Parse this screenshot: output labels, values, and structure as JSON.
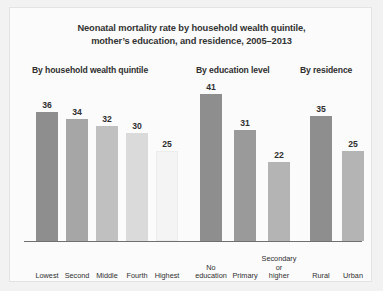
{
  "chart_data": {
    "type": "bar",
    "title_lines": [
      "Neonatal mortality rate by household wealth quintile,",
      "mother’s education, and residence, 2005–2013"
    ],
    "xlabel": "",
    "ylabel": "",
    "ylim": [
      0,
      41
    ],
    "grid": false,
    "legend": "none",
    "categories": [
      "Lowest",
      "Second",
      "Middle",
      "Fourth",
      "Highest",
      "No education",
      "Primary",
      "Secondary or higher",
      "Rural",
      "Urban"
    ],
    "values": [
      36,
      34,
      32,
      30,
      25,
      41,
      31,
      22,
      35,
      25
    ],
    "groups": [
      {
        "name": "By household wealth quintile",
        "categories": [
          "Lowest",
          "Second",
          "Middle",
          "Fourth",
          "Highest"
        ],
        "values": [
          36,
          34,
          32,
          30,
          25
        ],
        "colors": [
          "#8e8e8e",
          "#a6a6a6",
          "#c0c0c0",
          "#dadada",
          "#f4f4f4"
        ]
      },
      {
        "name": "By education level",
        "categories": [
          "No education",
          "Primary",
          "Secondary or higher"
        ],
        "values": [
          41,
          31,
          22
        ],
        "colors": [
          "#8e8e8e",
          "#9a9a9a",
          "#b4b4b4"
        ]
      },
      {
        "name": "By residence",
        "categories": [
          "Rural",
          "Urban"
        ],
        "values": [
          35,
          25
        ],
        "colors": [
          "#8e8e8e",
          "#b4b4b4"
        ]
      }
    ],
    "bars": [
      {
        "label_lines": [
          "Lowest"
        ],
        "value": 36,
        "color": "#8e8e8e",
        "x": 26
      },
      {
        "label_lines": [
          "Second"
        ],
        "value": 34,
        "color": "#a6a6a6",
        "x": 56
      },
      {
        "label_lines": [
          "Middle"
        ],
        "value": 32,
        "color": "#c0c0c0",
        "x": 86
      },
      {
        "label_lines": [
          "Fourth"
        ],
        "value": 30,
        "color": "#dadada",
        "x": 116
      },
      {
        "label_lines": [
          "Highest"
        ],
        "value": 25,
        "color": "#f4f4f4",
        "x": 146
      },
      {
        "label_lines": [
          "No",
          "education"
        ],
        "value": 41,
        "color": "#8e8e8e",
        "x": 190
      },
      {
        "label_lines": [
          "Primary"
        ],
        "value": 31,
        "color": "#9a9a9a",
        "x": 224
      },
      {
        "label_lines": [
          "Secondary",
          "or",
          "higher"
        ],
        "value": 22,
        "color": "#b4b4b4",
        "x": 258
      },
      {
        "label_lines": [
          "Rural"
        ],
        "value": 35,
        "color": "#8e8e8e",
        "x": 300
      },
      {
        "label_lines": [
          "Urban"
        ],
        "value": 25,
        "color": "#b4b4b4",
        "x": 332
      }
    ],
    "section_headers": [
      "By household wealth quintile",
      "By education level",
      "By residence"
    ],
    "colors": {
      "background": "#f2f2f2",
      "panel": "#fbfbfb",
      "axis": "#6f6f6f",
      "text": "#2f2f2f"
    }
  }
}
